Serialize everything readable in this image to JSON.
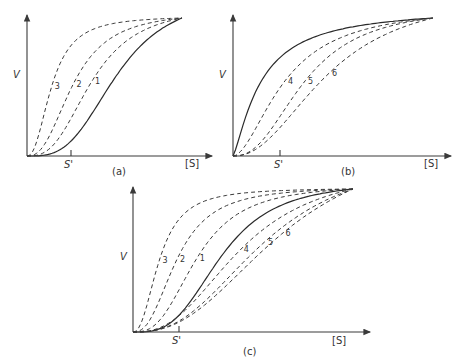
{
  "figure": {
    "panels": [
      {
        "id": "a",
        "caption": "(a)",
        "y_label": "V",
        "x_label": "[S]",
        "marker_label": "S'",
        "curves": [
          {
            "label": "",
            "style": "solid",
            "half_point": 0.58,
            "hill": 3.2
          },
          {
            "label": "1",
            "style": "dashed",
            "half_point": 0.42,
            "hill": 2.8
          },
          {
            "label": "2",
            "style": "dashed",
            "half_point": 0.3,
            "hill": 2.5
          },
          {
            "label": "3",
            "style": "dashed",
            "half_point": 0.16,
            "hill": 2.3
          }
        ]
      },
      {
        "id": "b",
        "caption": "(b)",
        "y_label": "V",
        "x_label": "[S]",
        "marker_label": "S'",
        "curves": [
          {
            "label": "",
            "style": "solid",
            "half_point": 0.14,
            "hill": 1.3
          },
          {
            "label": "4",
            "style": "dashed",
            "half_point": 0.26,
            "hill": 1.8
          },
          {
            "label": "5",
            "style": "dashed",
            "half_point": 0.36,
            "hill": 2.4
          },
          {
            "label": "6",
            "style": "dashed",
            "half_point": 0.48,
            "hill": 2.2
          }
        ]
      },
      {
        "id": "c",
        "caption": "(c)",
        "y_label": "V",
        "x_label": "[S]",
        "marker_label": "S'",
        "curves": [
          {
            "label": "",
            "style": "solid",
            "half_point": 0.4,
            "hill": 3.2
          },
          {
            "label": "1",
            "style": "dashed",
            "half_point": 0.29,
            "hill": 2.8
          },
          {
            "label": "2",
            "style": "dashed",
            "half_point": 0.2,
            "hill": 2.5
          },
          {
            "label": "3",
            "style": "dashed",
            "half_point": 0.12,
            "hill": 2.3
          },
          {
            "label": "4",
            "style": "dashed",
            "half_point": 0.49,
            "hill": 2.6
          },
          {
            "label": "5",
            "style": "dashed",
            "half_point": 0.6,
            "hill": 2.6
          },
          {
            "label": "6",
            "style": "dashed",
            "half_point": 0.68,
            "hill": 2.5
          }
        ]
      }
    ]
  }
}
